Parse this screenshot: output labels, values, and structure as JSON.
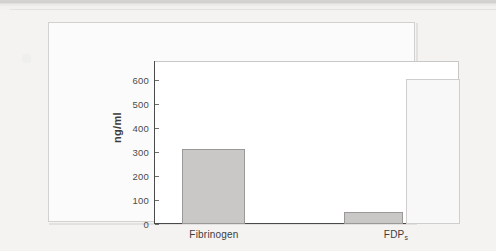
{
  "page": {
    "background_color": "#f2f1f0",
    "panel_border_color": "#d2d1d0"
  },
  "chart_data": {
    "type": "bar",
    "title": "",
    "xlabel": "",
    "ylabel": "ng/ml",
    "ylim": [
      0,
      680
    ],
    "yticks": [
      0,
      100,
      200,
      300,
      400,
      500,
      600
    ],
    "ytick_labels": [
      "0",
      "100",
      "200",
      "300",
      "400",
      "500",
      "600"
    ],
    "grid": false,
    "legend": "none",
    "categories": [
      "Fibrinogen",
      "FDPs"
    ],
    "category_labels": [
      {
        "text": "Fibrinogen",
        "sub": ""
      },
      {
        "text": "FDP",
        "sub": "s"
      }
    ],
    "bars": [
      {
        "category": "Fibrinogen",
        "series": "filled",
        "value": 315,
        "fill": "#c9c8c7",
        "stroke": "#9a9998"
      },
      {
        "category": "FDPs",
        "series": "filled",
        "value": 50,
        "fill": "#c9c8c7",
        "stroke": "#9a9998"
      },
      {
        "category": "FDPs",
        "series": "open",
        "value": 605,
        "fill": "#f8f8f8",
        "stroke": "#cfcecd"
      }
    ],
    "series": [
      {
        "name": "filled",
        "values": [
          315,
          50
        ]
      },
      {
        "name": "open",
        "values": [
          null,
          605
        ]
      }
    ],
    "axis_color": "#4a4a4a",
    "tick_color": "#6e6e6e"
  }
}
